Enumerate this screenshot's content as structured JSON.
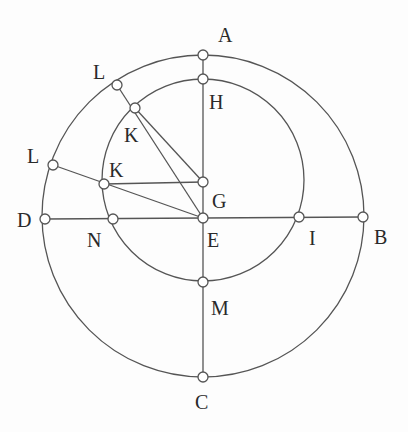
{
  "diagram": {
    "type": "geometry-construction",
    "colors": {
      "stroke": "#555555",
      "point_fill": "#ffffff",
      "label": "#2a2a2a",
      "background": "#fdfdfd"
    },
    "circles": [
      {
        "name": "outer-circle",
        "cx": 203,
        "cy": 216,
        "r": 161
      },
      {
        "name": "inner-circle",
        "cx": 203,
        "cy": 180,
        "r": 101
      }
    ],
    "points": {
      "A": {
        "x": 203,
        "y": 55
      },
      "H": {
        "x": 203,
        "y": 79
      },
      "G": {
        "x": 203,
        "y": 182
      },
      "E": {
        "x": 203,
        "y": 218
      },
      "M": {
        "x": 203,
        "y": 282
      },
      "C": {
        "x": 203,
        "y": 377
      },
      "D": {
        "x": 45,
        "y": 219
      },
      "N": {
        "x": 113,
        "y": 219
      },
      "I": {
        "x": 299,
        "y": 217
      },
      "B": {
        "x": 363,
        "y": 217
      },
      "L1": {
        "x": 117,
        "y": 85
      },
      "K1": {
        "x": 135,
        "y": 108
      },
      "L2": {
        "x": 53,
        "y": 165
      },
      "K2": {
        "x": 104,
        "y": 184
      }
    },
    "segments": [
      [
        "A",
        "C"
      ],
      [
        "D",
        "B"
      ],
      [
        "L1",
        "E"
      ],
      [
        "L2",
        "E"
      ],
      [
        "K1",
        "G"
      ],
      [
        "K2",
        "G"
      ]
    ],
    "labels": [
      {
        "text": "A",
        "x": 218,
        "y": 25
      },
      {
        "text": "H",
        "x": 209,
        "y": 92
      },
      {
        "text": "L",
        "x": 93,
        "y": 62
      },
      {
        "text": "K",
        "x": 124,
        "y": 125
      },
      {
        "text": "L",
        "x": 27,
        "y": 146
      },
      {
        "text": "K",
        "x": 109,
        "y": 160
      },
      {
        "text": "G",
        "x": 212,
        "y": 191
      },
      {
        "text": "D",
        "x": 17,
        "y": 210
      },
      {
        "text": "N",
        "x": 87,
        "y": 230
      },
      {
        "text": "E",
        "x": 207,
        "y": 230
      },
      {
        "text": "I",
        "x": 309,
        "y": 228
      },
      {
        "text": "B",
        "x": 374,
        "y": 227
      },
      {
        "text": "M",
        "x": 211,
        "y": 298
      },
      {
        "text": "C",
        "x": 195,
        "y": 392
      }
    ]
  }
}
